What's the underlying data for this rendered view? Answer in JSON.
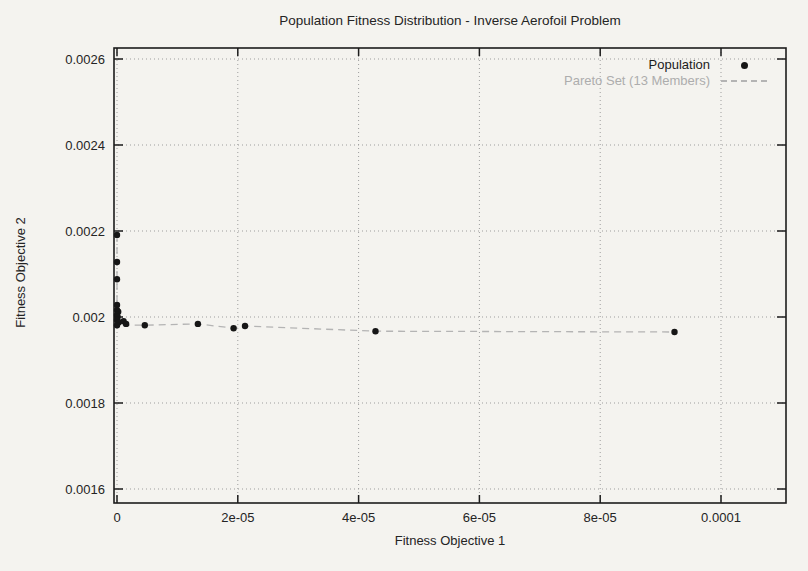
{
  "chart_data": {
    "type": "scatter",
    "title": "Population Fitness Distribution - Inverse Aerofoil Problem",
    "xlabel": "Fitness Objective 1",
    "ylabel": "Fitness Objective 2",
    "xlim": [
      0,
      0.00011
    ],
    "ylim": [
      0.0016,
      0.0026
    ],
    "x_tick_labels": [
      "0",
      "2e-05",
      "4e-05",
      "6e-05",
      "8e-05",
      "0.0001"
    ],
    "x_tick_values": [
      0,
      2e-05,
      4e-05,
      6e-05,
      8e-05,
      0.0001
    ],
    "y_tick_labels": [
      "0.0016",
      "0.0018",
      "0.002",
      "0.0022",
      "0.0024",
      "0.0026"
    ],
    "y_tick_values": [
      0.0016,
      0.0018,
      0.002,
      0.0022,
      0.0024,
      0.0026
    ],
    "grid": true,
    "grid_style": "dotted",
    "legend_position": "top-right-inside",
    "series": [
      {
        "name": "Population",
        "type": "scatter",
        "marker": "filled-circle",
        "color": "#161616",
        "points": [
          [
            0,
            0.002191
          ],
          [
            0,
            0.002128
          ],
          [
            0,
            0.002088
          ],
          [
            0,
            0.002028
          ],
          [
            0,
            0.002016
          ],
          [
            2e-07,
            0.002012
          ],
          [
            0,
            0.002005
          ],
          [
            1e-07,
            0.002
          ],
          [
            0,
            0.001993
          ],
          [
            3e-07,
            0.001988
          ],
          [
            1.1e-06,
            0.00199
          ],
          [
            1.5e-06,
            0.001984
          ],
          [
            0,
            0.001981
          ],
          [
            4.6e-06,
            0.001981
          ],
          [
            1.34e-05,
            0.001984
          ],
          [
            1.93e-05,
            0.001974
          ],
          [
            2.12e-05,
            0.001979
          ],
          [
            4.28e-05,
            0.001967
          ],
          [
            9.23e-05,
            0.001965
          ]
        ]
      },
      {
        "name": "Pareto Set (13 Members)",
        "type": "line",
        "style": "dashed",
        "color": "#b4b4b4",
        "points": [
          [
            0,
            0.002191
          ],
          [
            0,
            0.002128
          ],
          [
            0,
            0.002088
          ],
          [
            0,
            0.002028
          ],
          [
            0,
            0.002016
          ],
          [
            0,
            0.002005
          ],
          [
            0,
            0.001981
          ],
          [
            4.6e-06,
            0.001981
          ],
          [
            1.34e-05,
            0.001984
          ],
          [
            1.93e-05,
            0.001974
          ],
          [
            2.12e-05,
            0.001979
          ],
          [
            4.28e-05,
            0.001967
          ],
          [
            9.23e-05,
            0.001965
          ]
        ]
      }
    ]
  },
  "colors": {
    "background": "#f4f3ef",
    "ink": "#1c1c1c",
    "grid": "#9d9d9d",
    "pareto": "#b4b4b4"
  }
}
